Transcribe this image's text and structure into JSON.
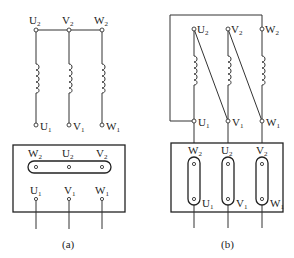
{
  "figure": {
    "panels": [
      {
        "id": "a",
        "caption": "(a)",
        "connection": "star",
        "top_terminals": [
          {
            "label": "U",
            "sub": "2"
          },
          {
            "label": "V",
            "sub": "2"
          },
          {
            "label": "W",
            "sub": "2"
          }
        ],
        "bottom_terminals": [
          {
            "label": "U",
            "sub": "1"
          },
          {
            "label": "V",
            "sub": "1"
          },
          {
            "label": "W",
            "sub": "1"
          }
        ],
        "box_top_row": [
          {
            "label": "W",
            "sub": "2"
          },
          {
            "label": "U",
            "sub": "2"
          },
          {
            "label": "V",
            "sub": "2"
          }
        ],
        "box_bottom_row": [
          {
            "label": "U",
            "sub": "1"
          },
          {
            "label": "V",
            "sub": "1"
          },
          {
            "label": "W",
            "sub": "1"
          }
        ]
      },
      {
        "id": "b",
        "caption": "(b)",
        "connection": "delta",
        "top_terminals": [
          {
            "label": "U",
            "sub": "2"
          },
          {
            "label": "V",
            "sub": "2"
          },
          {
            "label": "W",
            "sub": "2"
          }
        ],
        "bottom_terminals": [
          {
            "label": "U",
            "sub": "1"
          },
          {
            "label": "V",
            "sub": "1"
          },
          {
            "label": "W",
            "sub": "1"
          }
        ],
        "box_top_row": [
          {
            "label": "W",
            "sub": "2"
          },
          {
            "label": "U",
            "sub": "2"
          },
          {
            "label": "V",
            "sub": "2"
          }
        ],
        "box_bottom_row": [
          {
            "label": "U",
            "sub": "1"
          },
          {
            "label": "V",
            "sub": "1"
          },
          {
            "label": "W",
            "sub": "1"
          }
        ]
      }
    ]
  }
}
